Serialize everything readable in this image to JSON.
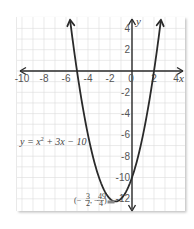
{
  "chart_data": {
    "type": "line",
    "title": "",
    "xlabel": "x",
    "ylabel": "y",
    "xlim": [
      -10.5,
      4.5
    ],
    "ylim": [
      -13,
      5
    ],
    "grid": true,
    "x_ticks": [
      -10,
      -8,
      -6,
      -4,
      -2,
      0,
      2,
      4
    ],
    "y_ticks": [
      4,
      2,
      -2,
      -4,
      -6,
      -8,
      -10,
      -12
    ],
    "series": [
      {
        "name": "y = x^2 + 3x - 10",
        "equation": "y = x² + 3x − 10",
        "coefficients": {
          "a": 1,
          "b": 3,
          "c": -10
        },
        "x_range": [
          -5.63,
          2.63
        ],
        "roots": [
          -5,
          2
        ],
        "y_intercept": -10,
        "vertex": {
          "x": -1.5,
          "y": -12.25,
          "label_x_num": "3",
          "label_x_den": "2",
          "label_y_num": "49",
          "label_y_den": "4"
        },
        "color": "#2a2a2a",
        "arrows_at_ends": true
      }
    ],
    "annotations": [
      {
        "text": "y = x² + 3x − 10",
        "position": "left of left branch, y≈-6"
      },
      {
        "text": "(−3/2, −49/4)",
        "position": "vertex label, left of vertex"
      }
    ]
  },
  "labels": {
    "x_axis": "x",
    "y_axis": "y",
    "equation_prefix": "y = x",
    "equation_exp": "2",
    "equation_suffix": " + 3x − 10",
    "vertex_open": "(−",
    "vertex_x_num": "3",
    "vertex_x_den": "2",
    "vertex_sep": ", −",
    "vertex_y_num": "49",
    "vertex_y_den": "4",
    "vertex_close": ")"
  },
  "colors": {
    "grid": "#dcdcdc",
    "axis": "#2a2a2a",
    "curve": "#2a2a2a",
    "background": "#ffffff",
    "vertex_marker": "#888888"
  }
}
